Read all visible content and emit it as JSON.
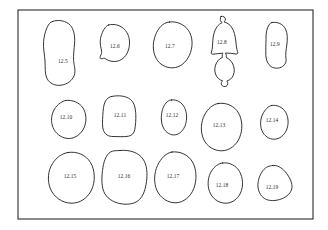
{
  "plate": {
    "background_color": "#ffffff",
    "frame": {
      "name": "plate-border",
      "x": 18,
      "y": 10,
      "width": 295,
      "height": 209,
      "stroke_color": "#2b2b2b"
    },
    "outline_stroke_color": "#1e1e1e",
    "label_text_color": "#2a2a2a"
  },
  "figures": [
    {
      "label": "12.5",
      "row": 1,
      "label_x": 63,
      "label_y": 62,
      "path": "M52.5,21.5 C58.5,19.2 66.5,20.8 70.5,25.5 C74.2,30.0 75.0,36.5 74.6,43.0 C74.2,49.0 73.2,55.0 73.6,60.5 C74.0,66.0 76.0,70.5 74.2,75.5 C72.4,80.5 67.0,84.5 61.0,85.2 C55.0,85.9 49.5,83.5 47.0,78.5 C44.6,73.7 45.4,67.5 45.0,61.0 C44.6,54.5 43.0,48.0 43.6,41.5 C44.2,34.5 46.5,27.0 49.5,23.5 C50.4,22.4 51.4,21.9 52.5,21.5 Z"
    },
    {
      "label": "12.6",
      "row": 1,
      "label_x": 115,
      "label_y": 47,
      "path": "M108.5,25.0 C114.5,23.2 121.5,25.5 125.5,30.5 C129.3,35.2 130.3,41.8 129.0,47.8 C127.8,53.5 124.5,58.5 119.5,60.5 C114.8,62.4 109.0,61.5 105.0,58.5 C104.0,57.7 103.2,58.6 102.0,58.8 C100.4,59.0 99.5,57.8 100.3,56.2 C101.2,54.4 102.0,53.0 101.6,51.0 C101.0,47.5 99.5,43.5 100.5,38.5 C101.6,33.0 104.2,27.8 107.3,25.6 C107.7,25.3 108.1,25.1 108.5,25.0 Z"
    },
    {
      "label": "12.7",
      "row": 1,
      "label_x": 170,
      "label_y": 47,
      "path": "M169.5,22.0 C177.0,21.0 184.5,24.5 188.5,30.5 C192.6,36.6 193.0,45.0 190.5,52.5 C188.0,60.0 182.5,66.0 175.5,67.5 C168.8,68.9 161.5,66.0 157.5,60.5 C153.4,54.9 152.5,47.0 154.0,40.0 C155.6,32.5 159.5,26.5 164.5,23.5 C166.1,22.5 167.8,22.2 169.5,22.0 Z"
    },
    {
      "label": "12.8",
      "row": 1,
      "label_x": 222,
      "label_y": 43,
      "path": "M221.0,16.5 C223.2,15.8 225.2,17.0 225.4,19.0 C225.5,20.3 224.8,21.2 224.0,21.9 C226.8,22.6 229.5,24.2 231.5,27.0 C234.2,30.8 235.2,36.0 235.8,41.0 C236.3,45.2 236.5,49.0 237.6,51.8 C238.2,53.3 237.4,54.2 236.0,54.0 C232.5,53.5 229.0,53.0 225.5,53.0 C226.2,54.5 226.6,56.2 226.3,57.6 C228.8,58.6 231.2,60.8 232.8,64.0 C234.6,67.7 234.8,72.0 233.2,75.5 C231.9,78.4 229.5,80.4 226.8,81.0 C227.6,81.8 228.0,83.0 227.7,84.2 C227.3,86.0 225.4,87.0 223.5,86.4 C221.8,85.9 220.9,84.2 221.3,82.6 C221.5,81.8 222.0,81.2 222.6,80.8 C219.5,80.0 216.8,77.5 215.5,74.0 C214.1,70.2 214.8,65.8 216.8,62.4 C218.3,59.8 220.4,58.2 222.4,57.5 C222.0,56.2 222.2,54.6 222.8,53.2 C219.5,53.4 216.2,53.8 213.0,54.2 C211.6,54.4 210.8,53.5 211.4,52.0 C212.6,49.0 212.5,45.0 212.8,40.8 C213.2,35.8 214.2,30.5 217.0,26.8 C218.5,24.8 220.3,23.4 222.2,22.6 C221.0,21.9 220.2,20.8 220.3,19.4 C220.4,18.1 220.5,17.0 221.0,16.5 Z"
    },
    {
      "label": "12.9",
      "row": 1,
      "label_x": 275,
      "label_y": 45,
      "path": "M272.0,22.5 C277.5,21.5 283.0,24.0 285.5,29.0 C287.8,33.6 287.5,39.5 286.8,45.0 C286.2,50.0 285.2,54.5 286.0,58.5 C286.6,61.5 285.5,64.5 282.5,66.5 C279.2,68.7 274.5,68.8 271.0,66.5 C267.7,64.3 266.2,60.2 265.8,55.5 C265.4,50.5 266.2,45.0 266.0,39.5 C265.8,33.5 266.8,27.5 269.5,24.2 C270.3,23.2 271.1,22.7 272.0,22.5 Z"
    },
    {
      "label": "12.10",
      "row": 2,
      "label_x": 66,
      "label_y": 118,
      "path": "M65.5,100.5 C72.5,99.5 79.5,102.5 83.0,108.0 C86.6,113.7 86.8,121.5 84.0,127.8 C81.2,134.0 75.5,138.2 69.5,138.5 C63.3,138.8 57.2,135.2 54.0,129.5 C50.8,123.8 50.8,116.5 53.5,111.0 C56.0,105.8 60.5,101.7 65.5,100.5 Z"
    },
    {
      "label": "12.11",
      "row": 2,
      "label_x": 120,
      "label_y": 116,
      "path": "M111.5,96.5 C118.5,95.0 126.0,95.8 130.5,99.5 C134.5,102.8 135.5,108.5 135.8,114.5 C136.0,120.0 135.5,125.5 134.8,129.5 C134.2,133.0 132.0,135.5 128.5,136.2 C124.0,137.1 118.0,136.5 113.0,136.5 C108.5,136.5 105.0,134.5 103.5,130.5 C102.0,126.5 102.5,121.0 102.8,115.5 C103.1,110.0 103.5,104.5 105.5,101.0 C107.0,98.4 109.2,97.0 111.5,96.5 Z"
    },
    {
      "label": "12.12",
      "row": 2,
      "label_x": 172,
      "label_y": 116,
      "path": "M171.5,100.0 C177.0,99.2 182.0,102.5 184.5,107.5 C187.0,112.6 187.2,119.0 185.5,124.5 C183.8,130.0 180.0,134.0 175.5,134.8 C170.8,135.6 166.0,132.8 163.5,128.0 C161.0,123.2 160.8,117.0 162.0,111.5 C163.2,106.0 166.0,101.8 169.5,100.4 C170.2,100.1 170.8,100.1 171.5,100.0 Z"
    },
    {
      "label": "12.13",
      "row": 2,
      "label_x": 219,
      "label_y": 126,
      "path": "M218.0,103.5 C226.5,102.2 234.5,106.0 238.5,113.0 C242.7,120.3 242.8,130.0 239.5,137.8 C236.2,145.5 229.5,150.5 222.0,150.8 C214.3,151.1 206.8,146.5 203.5,139.0 C200.2,131.5 200.8,122.0 204.5,115.0 C207.8,108.7 212.8,104.3 218.0,103.5 Z"
    },
    {
      "label": "12.14",
      "row": 2,
      "label_x": 272,
      "label_y": 121,
      "path": "M271.5,105.5 C277.5,104.5 283.0,107.5 285.8,112.5 C288.7,117.7 288.8,124.5 286.5,130.0 C284.2,135.5 279.5,139.0 274.5,139.2 C269.2,139.4 264.2,136.0 262.0,130.8 C259.8,125.6 260.2,119.0 262.8,114.0 C265.0,109.7 268.2,106.2 271.5,105.5 Z"
    },
    {
      "label": "12.15",
      "row": 3,
      "label_x": 70,
      "label_y": 177,
      "path": "M68.0,152.5 C77.0,151.0 86.0,155.0 90.5,162.5 C95.2,170.4 95.5,181.5 91.5,190.0 C87.5,198.5 79.5,203.5 71.0,203.2 C62.2,202.9 54.0,197.2 50.5,189.0 C47.0,180.8 48.0,170.5 52.5,163.5 C56.5,157.2 62.2,153.4 68.0,152.5 Z"
    },
    {
      "label": "12.16",
      "row": 3,
      "label_x": 124,
      "label_y": 177,
      "path": "M120.0,150.5 C129.5,149.5 138.5,152.5 143.0,159.0 C147.2,165.0 147.5,173.5 146.5,181.5 C145.6,188.8 143.5,195.5 139.5,199.5 C135.5,203.5 129.0,204.8 122.5,204.0 C115.5,203.1 108.5,199.8 105.0,194.0 C101.3,187.9 101.5,179.0 102.5,170.5 C103.5,162.2 105.8,154.8 110.5,152.0 C113.3,150.3 116.8,150.8 120.0,150.5 Z"
    },
    {
      "label": "12.17",
      "row": 3,
      "label_x": 173,
      "label_y": 177,
      "path": "M172.0,152.0 C180.5,151.0 188.5,155.0 192.5,162.0 C196.8,169.5 197.0,180.0 193.8,188.5 C190.5,197.0 183.5,202.5 176.0,202.8 C168.0,203.1 160.5,198.0 157.0,190.5 C153.5,183.0 154.0,173.0 157.5,165.5 C160.8,158.4 166.2,152.8 172.0,152.0 Z"
    },
    {
      "label": "12.18",
      "row": 3,
      "label_x": 222,
      "label_y": 186,
      "path": "M222.5,163.0 C229.5,162.0 236.0,165.5 239.5,171.5 C243.2,177.9 243.5,186.5 240.5,193.0 C237.5,199.5 231.5,203.5 225.0,203.2 C218.2,202.9 212.0,198.2 209.5,191.5 C207.0,184.8 208.0,176.5 211.5,171.0 C214.5,166.3 218.5,163.5 222.5,163.0 Z"
    },
    {
      "label": "12.19",
      "row": 3,
      "label_x": 272,
      "label_y": 188,
      "path": "M272.5,165.5 C277.0,164.8 281.5,167.5 285.0,171.5 C288.8,175.9 292.0,181.5 292.0,186.5 C292.0,191.5 288.5,195.5 283.5,198.0 C278.2,200.6 271.5,201.5 266.5,199.5 C261.5,197.5 258.5,192.5 258.0,187.0 C257.5,181.2 259.5,175.0 263.0,170.5 C266.0,166.7 269.5,165.9 272.5,165.5 Z"
    }
  ]
}
